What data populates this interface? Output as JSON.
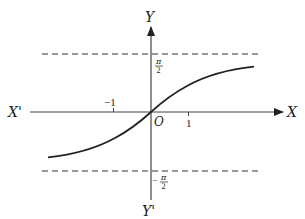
{
  "diagram": {
    "type": "function-graph",
    "function": "y = arctan(x)",
    "axes": {
      "x_label": "X",
      "x_neg_label": "X'",
      "y_label": "Y",
      "y_neg_label": "Y'",
      "origin_label": "O"
    },
    "ticks": {
      "x_neg_one": "−1",
      "x_one": "1"
    },
    "asymptotes": {
      "upper_label_num": "π",
      "upper_label_den": "2",
      "lower_label_sign": "−",
      "lower_label_num": "π",
      "lower_label_den": "2"
    },
    "colors": {
      "ink": "#222222",
      "axis": "#444444",
      "dash": "#333333"
    }
  }
}
